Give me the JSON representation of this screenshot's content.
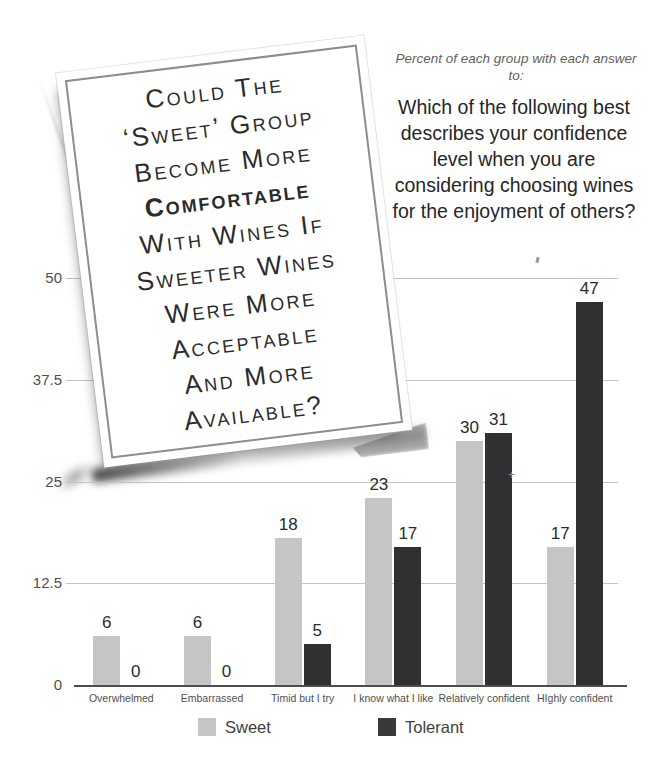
{
  "poster": {
    "lines": [
      {
        "text": "Could The",
        "bold": false
      },
      {
        "text": "‘Sweet’ Group",
        "bold": false
      },
      {
        "text": "Become More",
        "bold": false
      },
      {
        "text": "Comfortable",
        "bold": true
      },
      {
        "text": "With Wines If",
        "bold": false
      },
      {
        "text": "Sweeter Wines",
        "bold": false
      },
      {
        "text": "Were More",
        "bold": false
      },
      {
        "text": "Acceptable",
        "bold": false
      },
      {
        "text": "And More",
        "bold": false
      },
      {
        "text": "Available?",
        "bold": false
      }
    ]
  },
  "header": {
    "subtitle": "Percent of each group with each answer to:",
    "question": "Which of the following best describes your confidence level when you are considering choosing wines for the enjoyment of others?"
  },
  "chart_data": {
    "type": "bar",
    "categories": [
      "Overwhelmed",
      "Embarrassed",
      "Timid but I try",
      "I know what I like",
      "Relatively confident",
      "HIghly confident"
    ],
    "series": [
      {
        "name": "Sweet",
        "color": "#c5c5c6",
        "values": [
          6,
          6,
          18,
          23,
          30,
          17
        ]
      },
      {
        "name": "Tolerant",
        "color": "#303033",
        "values": [
          0,
          0,
          5,
          17,
          31,
          47
        ]
      }
    ],
    "ylim": [
      0,
      50
    ],
    "y_ticks": [
      50,
      37.5,
      25,
      12.5,
      0
    ],
    "y_tick_labels": [
      "50",
      "37.5",
      "25",
      "12.5",
      "0"
    ],
    "grid": true,
    "legend_position": "bottom",
    "value_labels": true
  },
  "legend": [
    {
      "label": "Sweet",
      "color": "#c5c5c6"
    },
    {
      "label": "Tolerant",
      "color": "#39393b"
    }
  ],
  "artifacts": {
    "plus": "+"
  }
}
